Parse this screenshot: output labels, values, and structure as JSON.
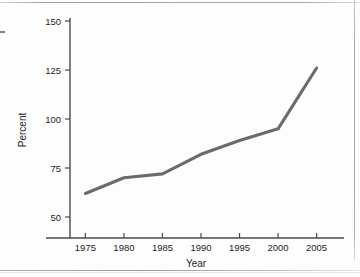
{
  "chart_data": {
    "type": "line",
    "title": "",
    "subtitle": "",
    "xlabel": "Year",
    "ylabel": "Percent",
    "x": [
      1975,
      1980,
      1985,
      1990,
      1995,
      2000,
      2005
    ],
    "values": [
      62,
      70,
      72,
      82,
      89,
      95,
      126
    ],
    "series": [
      {
        "name": "Percent",
        "values": [
          62,
          70,
          72,
          82,
          89,
          95,
          126
        ]
      }
    ],
    "xlim": [
      1973,
      2007
    ],
    "ylim": [
      45,
      150
    ],
    "xticks": [
      1975,
      1980,
      1985,
      1990,
      1995,
      2000,
      2005
    ],
    "xtick_labels": [
      "1975",
      "1980",
      "1985",
      "1990",
      "1995",
      "2000",
      "2005"
    ],
    "yticks": [
      50,
      75,
      100,
      125,
      150
    ],
    "ytick_labels": [
      "50",
      "75",
      "100",
      "125",
      "150"
    ],
    "grid": false,
    "legend": false,
    "legend_position": "none",
    "line_color": "#6b6b6b",
    "axis_color": "#4a4a4a",
    "background_color": "#ffffff",
    "annotations": []
  },
  "axes": {
    "y_axis_title": "Percent",
    "x_axis_title": "Year"
  }
}
